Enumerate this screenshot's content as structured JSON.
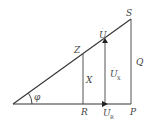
{
  "diagram": {
    "type": "phasor-triangle",
    "colors": {
      "line": "#333333",
      "label": "#444444",
      "background": "#ffffff"
    },
    "angle_label": "φ",
    "points": {
      "S": {
        "label": "S"
      },
      "Z": {
        "label": "Z"
      },
      "R": {
        "label": "R"
      },
      "P": {
        "label": "P"
      }
    },
    "segment_labels": {
      "X": "X",
      "Q": "Q"
    },
    "vectors": {
      "U": {
        "label": "U",
        "accent": "·"
      },
      "Ux": {
        "label": "U",
        "subscript": "X",
        "accent": "·"
      },
      "Ur": {
        "label": "U",
        "subscript": "R",
        "accent": "·"
      }
    }
  }
}
